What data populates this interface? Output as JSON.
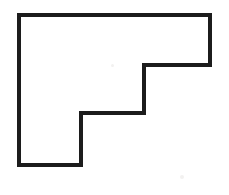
{
  "figure": {
    "name": "staircase-polygon",
    "canvas": {
      "width": 229,
      "height": 195,
      "background": "#ffffff"
    },
    "stroke": {
      "color": "#1c1c1c",
      "width": 4,
      "linejoin": "miter"
    },
    "fill": "#ffffff",
    "vertices": [
      {
        "label": "top-left",
        "x": 19,
        "y": 15
      },
      {
        "label": "top-right",
        "x": 210,
        "y": 15
      },
      {
        "label": "right-lower",
        "x": 210,
        "y": 65
      },
      {
        "label": "step-one-inner",
        "x": 144,
        "y": 65
      },
      {
        "label": "step-one-lower",
        "x": 144,
        "y": 113
      },
      {
        "label": "step-two-inner",
        "x": 81,
        "y": 113
      },
      {
        "label": "step-two-lower",
        "x": 81,
        "y": 165
      },
      {
        "label": "bottom-left",
        "x": 19,
        "y": 165
      }
    ],
    "points_attr": "19,15 210,15 210,65 144,65 144,113 81,113 81,165 19,165",
    "edges": [
      {
        "name": "top-edge",
        "orientation": "horizontal",
        "length": 191
      },
      {
        "name": "upper-right-edge",
        "orientation": "vertical",
        "length": 50
      },
      {
        "name": "first-step-tread",
        "orientation": "horizontal",
        "length": 66
      },
      {
        "name": "first-step-riser",
        "orientation": "vertical",
        "length": 48
      },
      {
        "name": "second-step-tread",
        "orientation": "horizontal",
        "length": 63
      },
      {
        "name": "second-step-riser",
        "orientation": "vertical",
        "length": 52
      },
      {
        "name": "bottom-edge",
        "orientation": "horizontal",
        "length": 62
      },
      {
        "name": "left-edge",
        "orientation": "vertical",
        "length": 150
      }
    ],
    "specks": [
      {
        "name": "artifact-upper",
        "x": 111,
        "y": 64,
        "size": 3
      },
      {
        "name": "artifact-lower",
        "x": 180,
        "y": 175,
        "size": 4
      }
    ]
  }
}
